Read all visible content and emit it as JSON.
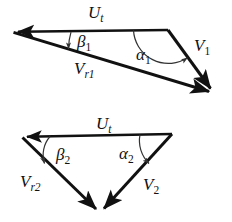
{
  "figure": {
    "background_color": "#ffffff",
    "stroke_color": "#111111",
    "arc_color": "#333333"
  },
  "triangles": [
    {
      "id": "upper-velocity-triangle",
      "name": "upper-velocity-triangle",
      "vertices": {
        "left": [
          13,
          32
        ],
        "top_right": [
          168,
          30
        ],
        "bottom_right": [
          214,
          93
        ]
      },
      "edges": [
        {
          "name": "blade-speed-vector-1",
          "label": "U",
          "subscript": "t",
          "label_x": 88,
          "label_y": 18,
          "from": [
            168,
            30
          ],
          "to": [
            13,
            32
          ],
          "arrow": "to"
        },
        {
          "name": "relative-velocity-vector-1",
          "label": "V",
          "subscript": "r1",
          "label_x": 74,
          "label_y": 74,
          "from": [
            13,
            32
          ],
          "to": [
            214,
            93
          ],
          "arrow": "to"
        },
        {
          "name": "absolute-velocity-vector-1",
          "label": "V",
          "subscript": "1",
          "label_x": 194,
          "label_y": 51,
          "from": [
            168,
            30
          ],
          "to": [
            214,
            93
          ],
          "arrow": "to"
        }
      ],
      "angles": [
        {
          "name": "relative-flow-angle-1",
          "label": "β",
          "subscript": "1",
          "label_x": 77,
          "label_y": 47,
          "vertex": [
            13,
            32
          ],
          "radius": 58
        },
        {
          "name": "absolute-flow-angle-1",
          "label": "α",
          "subscript": "1",
          "label_x": 136,
          "label_y": 60,
          "vertex": [
            168,
            30
          ],
          "radius": 35
        }
      ]
    },
    {
      "id": "lower-velocity-triangle",
      "name": "lower-velocity-triangle",
      "vertices": {
        "left": [
          22,
          137
        ],
        "top_right": [
          172,
          134
        ],
        "bottom": [
          100,
          213
        ]
      },
      "edges": [
        {
          "name": "blade-speed-vector-2",
          "label": "U",
          "subscript": "t",
          "label_x": 96,
          "label_y": 129,
          "from": [
            172,
            134
          ],
          "to": [
            22,
            137
          ],
          "arrow": "to"
        },
        {
          "name": "relative-velocity-vector-2",
          "label": "V",
          "subscript": "r2",
          "label_x": 20,
          "label_y": 187,
          "from": [
            22,
            137
          ],
          "to": [
            100,
            213
          ],
          "arrow": "to"
        },
        {
          "name": "absolute-velocity-vector-2",
          "label": "V",
          "subscript": "2",
          "label_x": 143,
          "label_y": 190,
          "from": [
            172,
            134
          ],
          "to": [
            100,
            213
          ],
          "arrow": "to"
        }
      ],
      "angles": [
        {
          "name": "relative-flow-angle-2",
          "label": "β",
          "subscript": "2",
          "label_x": 56,
          "label_y": 160,
          "vertex": [
            22,
            137
          ],
          "radius": 28
        },
        {
          "name": "absolute-flow-angle-2",
          "label": "α",
          "subscript": "2",
          "label_x": 119,
          "label_y": 159,
          "vertex": [
            172,
            134
          ],
          "radius": 32
        }
      ]
    }
  ]
}
